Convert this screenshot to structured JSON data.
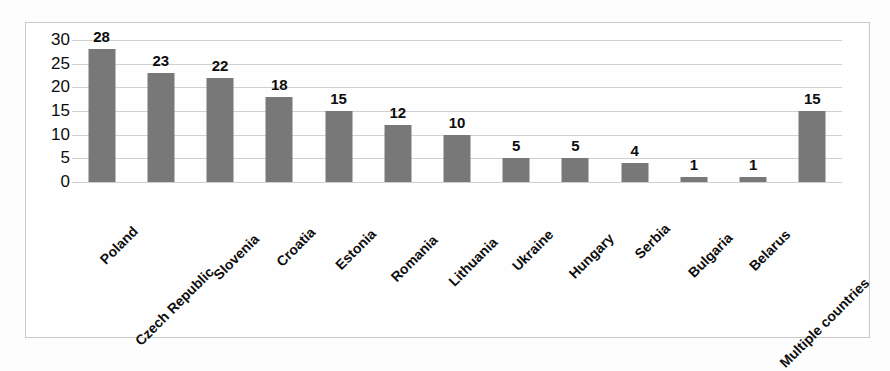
{
  "chart_data": {
    "type": "bar",
    "title": "",
    "subtitle": "",
    "xlabel": "",
    "ylabel": "",
    "categories": [
      "Poland",
      "Czech Republic",
      "Slovenia",
      "Croatia",
      "Estonia",
      "Romania",
      "Lithuania",
      "Ukraine",
      "Hungary",
      "Serbia",
      "Bulgaria",
      "Belarus",
      "Multiple countries"
    ],
    "values": [
      28,
      23,
      22,
      18,
      15,
      12,
      10,
      5,
      5,
      4,
      1,
      1,
      15
    ],
    "data_labels": [
      "28",
      "23",
      "22",
      "18",
      "15",
      "12",
      "10",
      "5",
      "5",
      "4",
      "1",
      "1",
      "15"
    ],
    "ylim": [
      0,
      30
    ],
    "y_ticks": [
      0,
      5,
      10,
      15,
      20,
      25,
      30
    ],
    "y_tick_labels": [
      "0",
      "5",
      "10",
      "15",
      "20",
      "25",
      "30"
    ],
    "grid": true,
    "grid_axis": "y",
    "legend": false,
    "legend_position": "none",
    "bar_color": "#787878",
    "gridline_color": "#d0d0d0",
    "frame_color": "#c9c9c9",
    "background_color": "#fdfdfd",
    "text_color": "#0d0d0d",
    "x_label_rotation_degrees": -45
  }
}
